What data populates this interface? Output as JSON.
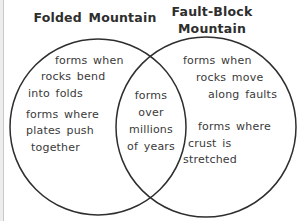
{
  "colors": {
    "stroke_color": "#2e2e2e",
    "text_color": "#3a3a3a",
    "background": "#ffffff",
    "edge_strip": "#ededed",
    "edge_line": "#c9c9c9"
  },
  "venn": {
    "type": "venn-diagram",
    "topic": "Folded Mountain vs Fault-Block Mountain",
    "left": {
      "title": "Folded Mountain",
      "facts": [
        {
          "lines": [
            "forms when",
            "rocks bend",
            "into folds"
          ]
        },
        {
          "lines": [
            "forms where",
            "plates push",
            "together"
          ]
        }
      ]
    },
    "center": {
      "lines": [
        "forms",
        "over",
        "millions",
        "of years"
      ]
    },
    "right": {
      "title_lines": [
        "Fault-Block",
        "Mountain"
      ],
      "facts": [
        {
          "lines": [
            "forms when",
            "rocks move",
            "along faults"
          ]
        },
        {
          "lines": [
            "forms where",
            "crust is",
            "stretched"
          ]
        }
      ]
    }
  }
}
